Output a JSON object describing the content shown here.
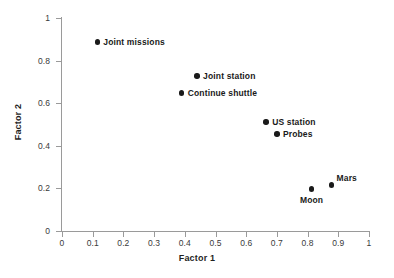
{
  "chart_data": {
    "type": "scatter",
    "title": "",
    "xlabel": "Factor 1",
    "ylabel": "Factor 2",
    "xlim": [
      0,
      1
    ],
    "ylim": [
      0,
      1
    ],
    "grid": false,
    "legend": "none",
    "xticks": [
      "0",
      "0.1",
      "0.2",
      "0.3",
      "0.4",
      "0.5",
      "0.6",
      "0.7",
      "0.8",
      "0.9",
      "1"
    ],
    "xtick_values": [
      0,
      0.1,
      0.2,
      0.3,
      0.4,
      0.5,
      0.6,
      0.7,
      0.8,
      0.9,
      1
    ],
    "yticks": [
      "0",
      "0.2",
      "0.4",
      "0.6",
      "0.8",
      "1"
    ],
    "ytick_values": [
      0,
      0.2,
      0.4,
      0.6,
      0.8,
      1
    ],
    "marker_color": "#1a1a1a",
    "axis_color": "#9a9a9a",
    "points": [
      {
        "label": "Joint missions",
        "x": 0.115,
        "y": 0.888,
        "label_pos": "right"
      },
      {
        "label": "Joint station",
        "x": 0.44,
        "y": 0.728,
        "label_pos": "right"
      },
      {
        "label": "Continue shuttle",
        "x": 0.39,
        "y": 0.648,
        "label_pos": "right"
      },
      {
        "label": "US station",
        "x": 0.665,
        "y": 0.512,
        "label_pos": "right"
      },
      {
        "label": "Probes",
        "x": 0.7,
        "y": 0.456,
        "label_pos": "right"
      },
      {
        "label": "Moon",
        "x": 0.813,
        "y": 0.197,
        "label_pos": "below"
      },
      {
        "label": "Mars",
        "x": 0.878,
        "y": 0.216,
        "label_pos": "above-right"
      }
    ]
  }
}
